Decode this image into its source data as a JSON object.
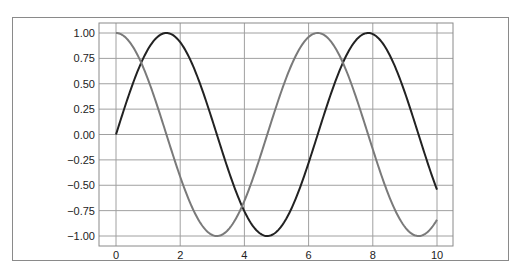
{
  "chart_data": {
    "type": "line",
    "title": "",
    "xlabel": "",
    "ylabel": "",
    "xlim": [
      -0.5,
      10.5
    ],
    "ylim": [
      -1.1,
      1.1
    ],
    "grid": true,
    "legend": null,
    "x_ticks": [
      0,
      2,
      4,
      6,
      8,
      10
    ],
    "x_tick_labels": [
      "0",
      "2",
      "4",
      "6",
      "8",
      "10"
    ],
    "y_ticks": [
      1.0,
      0.75,
      0.5,
      0.25,
      0.0,
      -0.25,
      -0.5,
      -0.75,
      -1.0
    ],
    "y_tick_labels": [
      "1.00",
      "0.75",
      "0.50",
      "0.25",
      "0.00",
      "−0.25",
      "−0.50",
      "−0.75",
      "−1.00"
    ],
    "series": [
      {
        "name": "sin(x)",
        "function": "sin",
        "x_range": [
          0,
          10
        ],
        "color": "#222222",
        "x": [
          0,
          1,
          1.5708,
          2,
          3,
          4,
          4.7124,
          5,
          6,
          7,
          7.854,
          8,
          9,
          10
        ],
        "values": [
          0.0,
          0.84,
          1.0,
          0.91,
          0.14,
          -0.76,
          -1.0,
          -0.96,
          -0.28,
          0.66,
          1.0,
          0.99,
          0.41,
          -0.54
        ]
      },
      {
        "name": "cos(x)",
        "function": "cos",
        "x_range": [
          0,
          10
        ],
        "color": "#7a7a7a",
        "x": [
          0,
          1,
          2,
          3,
          3.1416,
          4,
          5,
          6,
          6.2832,
          7,
          8,
          9,
          9.4248,
          10
        ],
        "values": [
          1.0,
          0.54,
          -0.42,
          -0.99,
          -1.0,
          -0.65,
          0.28,
          0.96,
          1.0,
          0.75,
          -0.15,
          -0.91,
          -1.0,
          -0.84
        ]
      }
    ]
  },
  "colors": {
    "grid": "#a0a0a0",
    "axes_frame": "#8a8a8a",
    "figure_frame": "#8a8a8a"
  }
}
